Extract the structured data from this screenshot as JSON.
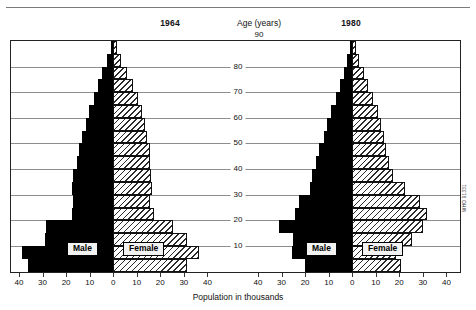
{
  "header": {
    "left_year": "1964",
    "right_year": "1980",
    "age_axis_title": "Age (years)",
    "age_axis_top_value": "90"
  },
  "axes": {
    "x_title": "Population in thousands",
    "x_ticks_left": [
      "40",
      "30",
      "20",
      "10",
      "0",
      "10",
      "20",
      "30",
      "40"
    ],
    "x_ticks_right": [
      "40",
      "30",
      "20",
      "10",
      "0",
      "10",
      "20",
      "30",
      "40"
    ],
    "age_ticks": [
      "10",
      "20",
      "30",
      "40",
      "50",
      "60",
      "70",
      "80"
    ],
    "x_min": -40,
    "x_max": 40,
    "age_min": 0,
    "age_max": 90
  },
  "legend": {
    "male_label": "Male",
    "female_label": "Female"
  },
  "credit": "WHO 91331",
  "colors": {
    "male_fill": "#000000",
    "female_fill": "#ffffff",
    "female_hatch": "#2b2b2b",
    "gridline": "#8d8d8d",
    "frame": "#222222",
    "background": "#ffffff"
  },
  "chart_data": {
    "type": "bar",
    "subtype": "population-pyramid",
    "xlabel": "Population in thousands",
    "ylabel": "Age (years)",
    "xlim": [
      -40,
      40
    ],
    "ylim": [
      0,
      90
    ],
    "grid": true,
    "legend": [
      "Male",
      "Female"
    ],
    "legend_position": "inside-center",
    "age_groups": [
      "0-4",
      "5-9",
      "10-14",
      "15-19",
      "20-24",
      "25-29",
      "30-34",
      "35-39",
      "40-44",
      "45-49",
      "50-54",
      "55-59",
      "60-64",
      "65-69",
      "70-74",
      "75-79",
      "80-84",
      "85-89"
    ],
    "panels": [
      {
        "name": "1964",
        "series": [
          {
            "name": "Male",
            "values": [
              36.0,
              38.5,
              29.0,
              28.5,
              17.5,
              17.0,
              17.5,
              17.0,
              15.5,
              14.5,
              13.0,
              11.5,
              10.0,
              8.0,
              6.5,
              4.5,
              2.5,
              1.0
            ]
          },
          {
            "name": "Female",
            "values": [
              31.5,
              36.5,
              31.5,
              25.5,
              17.5,
              15.5,
              16.5,
              16.0,
              15.5,
              15.5,
              14.5,
              13.5,
              12.5,
              10.5,
              8.5,
              6.0,
              3.5,
              1.5
            ]
          }
        ]
      },
      {
        "name": "1980",
        "series": [
          {
            "name": "Male",
            "values": [
              20.0,
              25.5,
              25.0,
              31.0,
              24.0,
              22.5,
              18.0,
              17.0,
              15.5,
              14.0,
              12.0,
              10.5,
              9.0,
              7.0,
              5.0,
              3.5,
              2.0,
              1.0
            ]
          },
          {
            "name": "Female",
            "values": [
              21.0,
              18.5,
              25.5,
              30.0,
              32.0,
              29.0,
              22.5,
              17.5,
              15.5,
              14.5,
              13.5,
              12.5,
              11.0,
              9.0,
              7.0,
              5.0,
              3.0,
              1.5
            ]
          }
        ]
      }
    ]
  }
}
